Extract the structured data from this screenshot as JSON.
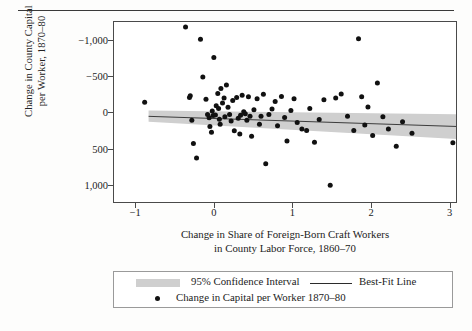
{
  "figure": {
    "type": "scatter-plot",
    "background": "#ffffff",
    "frame_color": "#4a4a4a"
  },
  "axes": {
    "y_title": "Change in County Capital\nper Worker, 1870–80",
    "x_title": "Change in Share of Foreign-Born Craft Workers\nin County Labor Force, 1860–70",
    "y_ticks": [
      "1,000",
      "500",
      "0",
      "−500",
      "−1,000"
    ],
    "x_ticks": [
      "−1",
      "0",
      "1",
      "2",
      "3"
    ]
  },
  "legend": {
    "ci_label": "95% Confidence Interval",
    "bestfit_label": "Best-Fit Line",
    "points_label": "Change in Capital per Worker 1870–80",
    "band_color": "#cfcfcf",
    "line_color": "#2b2b2b",
    "point_color": "#111111"
  },
  "chart_data": {
    "type": "scatter",
    "title": "",
    "xlabel": "Change in Share of Foreign-Born Craft Workers in County Labor Force, 1860–70",
    "ylabel": "Change in County Capital per Worker, 1870–80",
    "xlim": [
      -1.27,
      3.08
    ],
    "ylim": [
      -1240,
      1250
    ],
    "xticks": [
      -1,
      0,
      1,
      2,
      3
    ],
    "yticks": [
      -1000,
      -500,
      0,
      500,
      1000
    ],
    "grid": false,
    "legend_position": "below-axes",
    "series": [
      {
        "name": "Change in Capital per Worker 1870–80",
        "marker": "filled-circle",
        "color": "#111111",
        "points": [
          [
            -0.88,
            140
          ],
          [
            -0.36,
            1180
          ],
          [
            -0.3,
            230
          ],
          [
            -0.31,
            205
          ],
          [
            -0.28,
            -110
          ],
          [
            -0.26,
            -430
          ],
          [
            -0.22,
            -630
          ],
          [
            -0.17,
            1010
          ],
          [
            -0.14,
            490
          ],
          [
            -0.1,
            180
          ],
          [
            -0.08,
            -30
          ],
          [
            -0.06,
            -75
          ],
          [
            -0.05,
            -195
          ],
          [
            -0.03,
            -275
          ],
          [
            -0.02,
            20
          ],
          [
            -0.01,
            -45
          ],
          [
            0.0,
            760
          ],
          [
            0.02,
            -35
          ],
          [
            0.03,
            90
          ],
          [
            0.05,
            260
          ],
          [
            0.06,
            55
          ],
          [
            0.07,
            -95
          ],
          [
            0.08,
            -165
          ],
          [
            0.09,
            330
          ],
          [
            0.11,
            130
          ],
          [
            0.13,
            200
          ],
          [
            0.14,
            -60
          ],
          [
            0.16,
            380
          ],
          [
            0.18,
            70
          ],
          [
            0.2,
            -30
          ],
          [
            0.22,
            -120
          ],
          [
            0.24,
            165
          ],
          [
            0.26,
            -255
          ],
          [
            0.29,
            205
          ],
          [
            0.31,
            -80
          ],
          [
            0.33,
            -300
          ],
          [
            0.34,
            -40
          ],
          [
            0.36,
            235
          ],
          [
            0.38,
            10
          ],
          [
            0.4,
            -20
          ],
          [
            0.42,
            -110
          ],
          [
            0.44,
            215
          ],
          [
            0.46,
            -55
          ],
          [
            0.48,
            -330
          ],
          [
            0.51,
            35
          ],
          [
            0.55,
            190
          ],
          [
            0.58,
            -165
          ],
          [
            0.6,
            -55
          ],
          [
            0.63,
            250
          ],
          [
            0.66,
            -710
          ],
          [
            0.7,
            -30
          ],
          [
            0.74,
            45
          ],
          [
            0.78,
            150
          ],
          [
            0.81,
            -185
          ],
          [
            0.86,
            220
          ],
          [
            0.9,
            -70
          ],
          [
            0.93,
            -395
          ],
          [
            0.98,
            25
          ],
          [
            1.02,
            190
          ],
          [
            1.06,
            -140
          ],
          [
            1.12,
            -230
          ],
          [
            1.18,
            -250
          ],
          [
            1.22,
            55
          ],
          [
            1.28,
            -415
          ],
          [
            1.34,
            -100
          ],
          [
            1.4,
            175
          ],
          [
            1.48,
            -1010
          ],
          [
            1.55,
            200
          ],
          [
            1.62,
            255
          ],
          [
            1.7,
            -55
          ],
          [
            1.78,
            -250
          ],
          [
            1.84,
            1020
          ],
          [
            1.88,
            215
          ],
          [
            1.92,
            -175
          ],
          [
            1.96,
            75
          ],
          [
            2.02,
            -320
          ],
          [
            2.08,
            405
          ],
          [
            2.15,
            -60
          ],
          [
            2.22,
            -230
          ],
          [
            2.32,
            -470
          ],
          [
            2.4,
            -130
          ],
          [
            2.52,
            -290
          ],
          [
            3.04,
            -420
          ]
        ]
      }
    ],
    "best_fit_line": {
      "name": "Best-Fit Line",
      "color": "#2b2b2b",
      "x_start": -0.83,
      "y_start": -55,
      "x_end": 3.08,
      "y_end": -195
    },
    "confidence_band": {
      "name": "95% Confidence Interval",
      "level": 0.95,
      "color": "#cfcfcf",
      "x_start": -0.83,
      "x_end": 3.08,
      "upper_start": 25,
      "lower_start": -130,
      "upper_end": -25,
      "lower_end": -370
    }
  }
}
